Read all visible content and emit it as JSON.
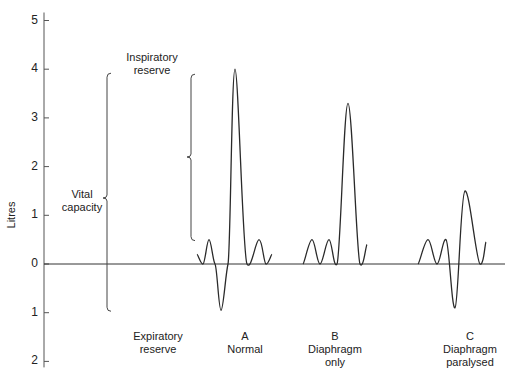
{
  "chart_data": {
    "type": "line",
    "title": "",
    "ylabel": "Litres",
    "xlabel": "",
    "ylim": [
      -2,
      5
    ],
    "yticks": [
      {
        "value": 5,
        "label": "5"
      },
      {
        "value": 4,
        "label": "4"
      },
      {
        "value": 3,
        "label": "3"
      },
      {
        "value": 2,
        "label": "2"
      },
      {
        "value": 1,
        "label": "1"
      },
      {
        "value": 0,
        "label": "0"
      },
      {
        "value": -1,
        "label": "1"
      },
      {
        "value": -2,
        "label": "2"
      }
    ],
    "grid": false,
    "baseline": 0,
    "series": [
      {
        "name": "A Normal",
        "label_letter": "A",
        "label_lines": [
          "Normal"
        ],
        "description": "Two quiet breaths, a maximal expiration then maximal inspiration",
        "points": [
          [
            0,
            0.2
          ],
          [
            1,
            0
          ],
          [
            2,
            0.5
          ],
          [
            3,
            0
          ],
          [
            4,
            -0.95
          ],
          [
            5,
            0
          ],
          [
            6,
            4.0
          ],
          [
            7,
            0
          ],
          [
            8,
            0.5
          ],
          [
            9,
            0
          ],
          [
            10,
            0.2
          ]
        ]
      },
      {
        "name": "B Diaphragm only",
        "label_letter": "B",
        "label_lines": [
          "Diaphragm",
          "only"
        ],
        "description": "Two quiet breaths then maximal inspiration",
        "points": [
          [
            0,
            0
          ],
          [
            1,
            0.5
          ],
          [
            2,
            0
          ],
          [
            3,
            0.5
          ],
          [
            4,
            0
          ],
          [
            5,
            3.3
          ],
          [
            6,
            0
          ],
          [
            7,
            0.4
          ]
        ]
      },
      {
        "name": "C Diaphragm paralysed",
        "label_letter": "C",
        "label_lines": [
          "Diaphragm",
          "paralysed"
        ],
        "description": "Two quiet breaths, expiration then reduced inspiration",
        "points": [
          [
            0,
            0
          ],
          [
            1,
            0.5
          ],
          [
            2,
            0
          ],
          [
            3,
            0.5
          ],
          [
            4,
            -0.9
          ],
          [
            5,
            1.5
          ],
          [
            6,
            0
          ],
          [
            7,
            0.45
          ]
        ]
      }
    ],
    "annotations": [
      {
        "type": "brace",
        "name": "vital-capacity",
        "label_lines": [
          "Vital",
          "capacity"
        ],
        "from": -0.95,
        "to": 4.0
      },
      {
        "type": "brace",
        "name": "inspiratory-reserve",
        "label_lines": [
          "Inspiratory",
          "reserve"
        ],
        "from": 0.5,
        "to": 4.0
      },
      {
        "type": "label",
        "name": "expiratory-reserve",
        "label_lines": [
          "Expiratory",
          "reserve"
        ]
      }
    ]
  },
  "labels": {
    "ylabel": "Litres",
    "vital_1": "Vital",
    "vital_2": "capacity",
    "insp_1": "Inspiratory",
    "insp_2": "reserve",
    "exp_1": "Expiratory",
    "exp_2": "reserve",
    "a_letter": "A",
    "a_1": "Normal",
    "b_letter": "B",
    "b_1": "Diaphragm",
    "b_2": "only",
    "c_letter": "C",
    "c_1": "Diaphragm",
    "c_2": "paralysed"
  }
}
